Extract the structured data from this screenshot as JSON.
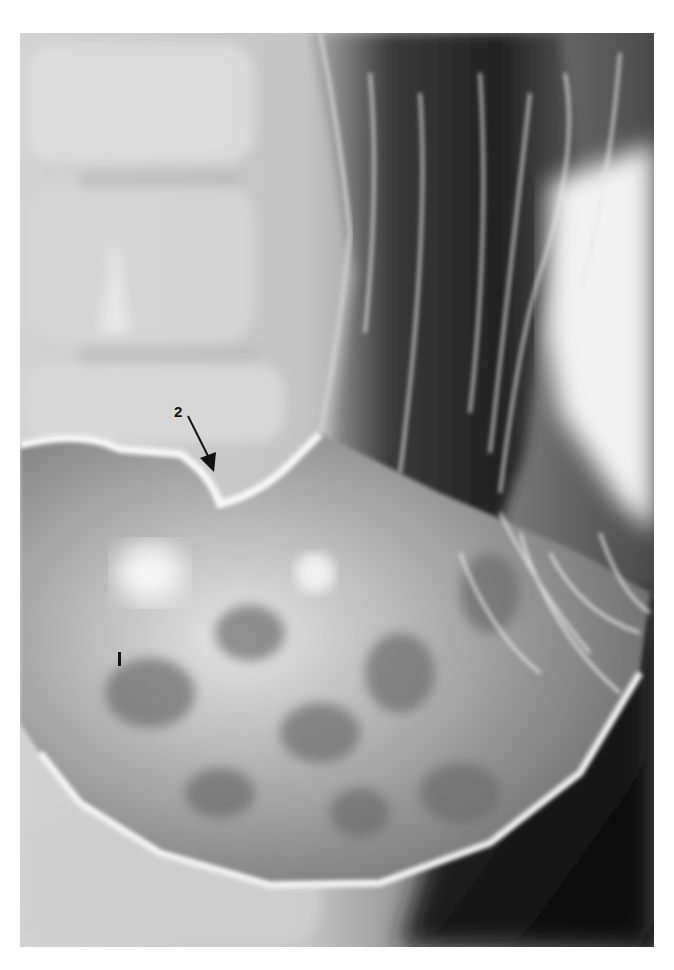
{
  "image": {
    "description": "Barium contrast radiograph of the stomach (double-contrast view) with lumbar vertebrae visible on the left",
    "colors": {
      "background": "#ffffff",
      "bone_light": "#d8d8d8",
      "soft_tissue": "#bdbdbd",
      "gas_dark": "#1a1a1a",
      "barium_white": "#f4f4f4"
    }
  },
  "annotations": [
    {
      "id": "1",
      "label": "1",
      "style": "vertical tick mark",
      "position": "lower left within stomach"
    },
    {
      "id": "2",
      "label": "2",
      "style": "numeral with arrow pointing down-right",
      "position": "angular notch of lesser curvature"
    }
  ]
}
